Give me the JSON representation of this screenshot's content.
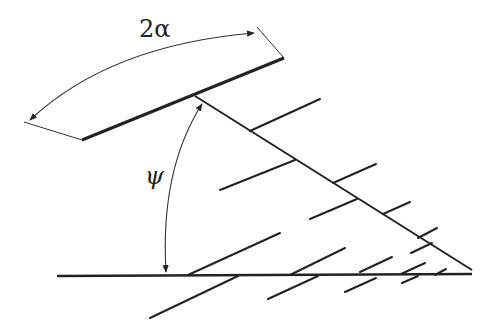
{
  "diagram": {
    "labels": {
      "angle_top": "2α",
      "angle_side": "ψ"
    },
    "colors": {
      "ink": "#222222",
      "background": "#ffffff"
    },
    "elements": {
      "blade_line": {
        "from": [
          82,
          140
        ],
        "to": [
          284,
          58
        ]
      },
      "diagonal_line": {
        "from": [
          195,
          96
        ],
        "to": [
          472,
          270
        ]
      },
      "base_line": {
        "from": [
          57,
          276
        ],
        "to": [
          472,
          274
        ]
      },
      "angle_2alpha_arc": {
        "from": [
          29,
          120
        ],
        "to": [
          255,
          33
        ],
        "label": "2α"
      },
      "angle_psi_arc": {
        "from": [
          165,
          273
        ],
        "to": [
          202,
          104
        ],
        "label": "ψ"
      }
    }
  }
}
